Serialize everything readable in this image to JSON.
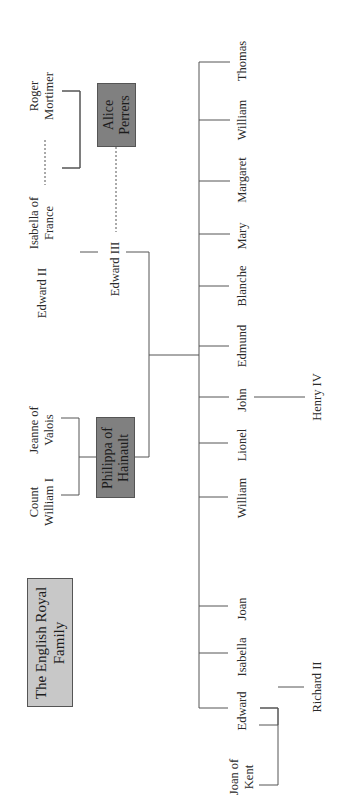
{
  "title": {
    "line1": "The English Royal",
    "line2": "Family"
  },
  "colors": {
    "line": "#555555",
    "spouse_box": "#808080",
    "title_box": "#c8c8c8"
  },
  "grandparents_paternal": {
    "edward_ii": "Edward II",
    "isabella": {
      "line1": "Isabella of",
      "line2": "France"
    },
    "roger": {
      "line1": "Roger",
      "line2": "Mortimer"
    }
  },
  "grandparents_maternal": {
    "count": {
      "line1": "Count",
      "line2": "William I"
    },
    "jeanne": {
      "line1": "Jeanne of",
      "line2": "Valois"
    }
  },
  "king": "Edward III",
  "queen": {
    "line1": "Philippa of",
    "line2": "Hainault"
  },
  "mistress": {
    "line1": "Alice",
    "line2": "Perrers"
  },
  "children": [
    {
      "name": "Edward"
    },
    {
      "name": "Isabella"
    },
    {
      "name": "Joan"
    },
    {
      "name": "William"
    },
    {
      "name": "Lionel"
    },
    {
      "name": "John"
    },
    {
      "name": "Edmund"
    },
    {
      "name": "Blanche"
    },
    {
      "name": "Mary"
    },
    {
      "name": "Margaret"
    },
    {
      "name": "William"
    },
    {
      "name": "Thomas"
    }
  ],
  "grandchildren": {
    "joan_of_kent": {
      "line1": "Joan of",
      "line2": "Kent"
    },
    "richard_ii": "Richard II",
    "henry_iv": "Henry IV"
  }
}
